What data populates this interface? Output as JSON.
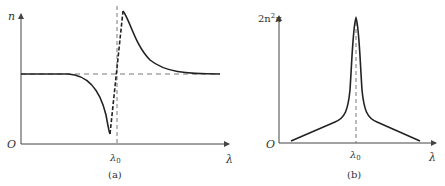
{
  "panels": [
    {
      "id": "a",
      "caption": "(a)",
      "y_axis_label": "n",
      "x_axis_label": "λ",
      "origin_label": "O",
      "marker_label": "λ",
      "marker_sub": "0",
      "description": "Refractive index n versus wavelength λ showing anomalous dispersion near λ0"
    },
    {
      "id": "b",
      "caption": "(b)",
      "y_axis_label": "2n",
      "y_axis_sup": "2",
      "y_axis_tail": "κ",
      "x_axis_label": "λ",
      "origin_label": "O",
      "marker_label": "λ",
      "marker_sub": "0",
      "description": "Absorption 2n²κ versus wavelength λ with peak at λ0"
    }
  ],
  "colors": {
    "line": "#222222",
    "axis": "#444444",
    "text": "#333333"
  }
}
